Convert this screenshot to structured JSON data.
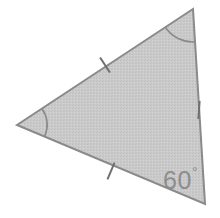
{
  "figure": {
    "name": "isosceles-triangle-with-60-degree-angle",
    "canvas": {
      "width": 220,
      "height": 218
    },
    "background_color": "#ffffff",
    "shape": {
      "type": "triangle",
      "fill_color": "#c9c9c9",
      "stroke_color": "#8a8a8a",
      "stroke_width": 2,
      "texture": "halftone-dither",
      "vertices": [
        {
          "name": "apex",
          "x": 193,
          "y": 9
        },
        {
          "name": "left",
          "x": 17,
          "y": 125
        },
        {
          "name": "bottom-right",
          "x": 205,
          "y": 204
        }
      ]
    },
    "side_tick_marks": [
      {
        "name": "tick-upper-left-side",
        "side": "apex-to-left",
        "count": 1,
        "center_x": 105,
        "center_y": 65,
        "length": 18,
        "angle_deg": 57
      },
      {
        "name": "tick-bottom-side",
        "side": "left-to-bottom-right",
        "count": 1,
        "center_x": 111,
        "center_y": 171,
        "length": 18,
        "angle_deg": 113
      },
      {
        "name": "tick-right-side",
        "side": "bottom-right-to-apex",
        "count": 1,
        "center_x": 199,
        "center_y": 110,
        "length": 18,
        "angle_deg": 94
      }
    ],
    "angle_arcs": [
      {
        "name": "arc-apex-angle",
        "vertex": "apex",
        "radius": 33,
        "stroke_color": "#8a8a8a"
      },
      {
        "name": "arc-left-angle",
        "vertex": "left",
        "radius": 30,
        "stroke_color": "#8a8a8a"
      }
    ],
    "angle_labels": [
      {
        "name": "angle-label-bottom-right",
        "value": "60",
        "degree_symbol": "°",
        "full_text": "60°",
        "x": 163,
        "y": 189,
        "color": "#8d8d8d"
      }
    ]
  }
}
